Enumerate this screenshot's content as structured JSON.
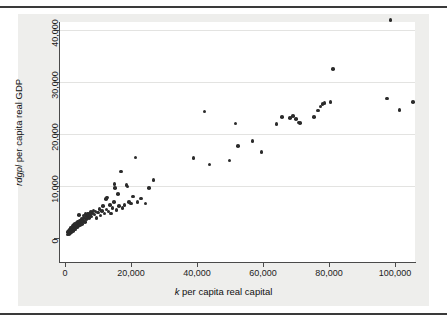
{
  "figure": {
    "background": "#eeeeec",
    "plot_background": "#ffffff",
    "marker_color": "#2b2b2b",
    "axis_color": "#4a4a4a",
    "grid_color": "#e3e3e1"
  },
  "axes": {
    "y_title": "rdgpl per capita real GDP",
    "y_title_italic": "rdgpl",
    "y_title_rest": " per capita real GDP",
    "x_title": "k per capita real capital",
    "x_title_italic": "k",
    "x_title_rest": " per capita real capital",
    "y_ticks": [
      "0",
      "10,000",
      "20,000",
      "30,000",
      "40,000"
    ],
    "x_ticks": [
      "0",
      "20,000",
      "40,000",
      "60,000",
      "80,000",
      "100,000"
    ]
  },
  "chart_data": {
    "type": "scatter",
    "title": "",
    "xlabel": "k per capita real capital",
    "ylabel": "rdgpl per capita real GDP",
    "xlim": [
      0,
      108000
    ],
    "ylim": [
      0,
      43500
    ],
    "xticks": [
      0,
      20000,
      40000,
      60000,
      80000,
      100000
    ],
    "yticks": [
      0,
      10000,
      20000,
      30000,
      40000
    ],
    "grid": true,
    "legend": null,
    "marker": "filled-circle",
    "points": [
      [
        700,
        700
      ],
      [
        900,
        1100
      ],
      [
        1000,
        900
      ],
      [
        1100,
        1400
      ],
      [
        1200,
        800
      ],
      [
        1300,
        1200
      ],
      [
        1400,
        1600
      ],
      [
        1500,
        1000
      ],
      [
        1600,
        1500
      ],
      [
        1700,
        1900
      ],
      [
        1800,
        1300
      ],
      [
        1900,
        1700
      ],
      [
        2000,
        1100
      ],
      [
        2100,
        2000
      ],
      [
        2200,
        1500
      ],
      [
        2300,
        1800
      ],
      [
        2400,
        2300
      ],
      [
        2500,
        1400
      ],
      [
        2600,
        2100
      ],
      [
        2700,
        1700
      ],
      [
        2800,
        2500
      ],
      [
        2900,
        1900
      ],
      [
        3000,
        2200
      ],
      [
        3100,
        2700
      ],
      [
        3200,
        1600
      ],
      [
        3400,
        2400
      ],
      [
        3500,
        2900
      ],
      [
        3600,
        2000
      ],
      [
        3800,
        2600
      ],
      [
        3900,
        3200
      ],
      [
        4000,
        2300
      ],
      [
        4200,
        2800
      ],
      [
        4300,
        4400
      ],
      [
        4500,
        3400
      ],
      [
        4600,
        2500
      ],
      [
        4800,
        3000
      ],
      [
        5000,
        3700
      ],
      [
        5200,
        2700
      ],
      [
        5400,
        3300
      ],
      [
        5600,
        4300
      ],
      [
        5800,
        3900
      ],
      [
        6000,
        3100
      ],
      [
        6200,
        4600
      ],
      [
        6500,
        3600
      ],
      [
        6700,
        4200
      ],
      [
        7000,
        4700
      ],
      [
        7200,
        3900
      ],
      [
        7500,
        4400
      ],
      [
        7800,
        5000
      ],
      [
        8000,
        4100
      ],
      [
        8300,
        4800
      ],
      [
        8600,
        5300
      ],
      [
        9000,
        4500
      ],
      [
        9300,
        5100
      ],
      [
        9600,
        3800
      ],
      [
        10000,
        4900
      ],
      [
        10400,
        5600
      ],
      [
        10800,
        4300
      ],
      [
        11200,
        5200
      ],
      [
        11600,
        6100
      ],
      [
        12000,
        4700
      ],
      [
        12400,
        7500
      ],
      [
        12600,
        5500
      ],
      [
        12800,
        7800
      ],
      [
        13200,
        5100
      ],
      [
        13600,
        6300
      ],
      [
        14000,
        4700
      ],
      [
        14400,
        5800
      ],
      [
        14800,
        6900
      ],
      [
        15000,
        10400
      ],
      [
        15200,
        9600
      ],
      [
        15600,
        5400
      ],
      [
        16000,
        8500
      ],
      [
        16400,
        6200
      ],
      [
        17000,
        12800
      ],
      [
        17400,
        5800
      ],
      [
        18000,
        6400
      ],
      [
        18600,
        10200
      ],
      [
        19000,
        9900
      ],
      [
        19400,
        6900
      ],
      [
        20000,
        6600
      ],
      [
        20600,
        8000
      ],
      [
        21400,
        15500
      ],
      [
        22000,
        6900
      ],
      [
        23000,
        7600
      ],
      [
        24400,
        6600
      ],
      [
        25400,
        9600
      ],
      [
        26800,
        11200
      ],
      [
        38900,
        15400
      ],
      [
        42300,
        24300
      ],
      [
        43800,
        14100
      ],
      [
        49800,
        14900
      ],
      [
        51700,
        22000
      ],
      [
        52400,
        17700
      ],
      [
        56800,
        18700
      ],
      [
        59600,
        16500
      ],
      [
        64100,
        21900
      ],
      [
        65800,
        23300
      ],
      [
        68200,
        23100
      ],
      [
        69100,
        23500
      ],
      [
        70000,
        22900
      ],
      [
        70800,
        22200
      ],
      [
        71200,
        22100
      ],
      [
        75400,
        23300
      ],
      [
        76600,
        24500
      ],
      [
        77400,
        25300
      ],
      [
        78000,
        25800
      ],
      [
        78600,
        26000
      ],
      [
        80500,
        26100
      ],
      [
        81200,
        32500
      ],
      [
        98600,
        41900
      ],
      [
        97600,
        26800
      ],
      [
        101400,
        24600
      ],
      [
        105500,
        26100
      ]
    ]
  }
}
